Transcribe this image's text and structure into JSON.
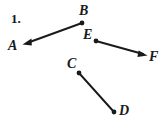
{
  "figure": {
    "question_number": "1.",
    "background_color": "#ffffff",
    "ink_color": "#1a1a1a",
    "width": 165,
    "height": 126,
    "points": [
      {
        "id": "A",
        "label": "A",
        "x": 24,
        "y": 44,
        "marker": "arrowhead"
      },
      {
        "id": "B",
        "label": "B",
        "x": 82,
        "y": 23,
        "marker": "dot"
      },
      {
        "id": "E",
        "label": "E",
        "x": 96,
        "y": 41,
        "marker": "dot"
      },
      {
        "id": "F",
        "label": "F",
        "x": 146,
        "y": 55,
        "marker": "arrowhead"
      },
      {
        "id": "C",
        "label": "C",
        "x": 79,
        "y": 73,
        "marker": "dot"
      },
      {
        "id": "D",
        "label": "D",
        "x": 114,
        "y": 112,
        "marker": "dot"
      }
    ],
    "segments": [
      {
        "id": "AB",
        "from": "B",
        "to": "A",
        "type": "ray",
        "arrow_at": "A",
        "label": "ray BA"
      },
      {
        "id": "EF",
        "from": "E",
        "to": "F",
        "type": "ray",
        "arrow_at": "F",
        "label": "ray EF"
      },
      {
        "id": "CD",
        "from": "C",
        "to": "D",
        "type": "segment",
        "arrow_at": "none",
        "label": "segment CD"
      }
    ]
  }
}
